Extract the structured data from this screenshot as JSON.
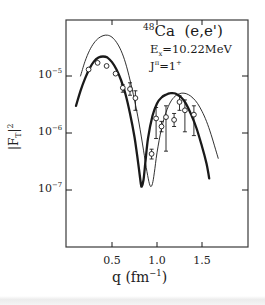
{
  "chart_data": {
    "type": "line",
    "annotations": {
      "nucleus_mass": "48",
      "nucleus_symbol": "Ca",
      "reaction": "(e,e')",
      "excitation_label": "E",
      "excitation_sub": "x",
      "excitation_value": "=10.22MeV",
      "spin_label": "J",
      "spin_sup": "π",
      "spin_value": "=1",
      "spin_parity": "+"
    },
    "xlabel": "q (fm⁻¹)",
    "xlabel_parts": {
      "main": "q  (fm",
      "sup": "−1",
      "end": ")"
    },
    "ylabel": "|F_T|²",
    "ylabel_parts": {
      "main": "|F",
      "sub": "T",
      "sup": "2",
      "end": "|"
    },
    "xlim": [
      0.0,
      2.02
    ],
    "ylim_log10": [
      -4.25,
      -7.97
    ],
    "yscale": "log",
    "x_ticks": [
      0.5,
      1.0,
      1.5
    ],
    "x_tick_labels": [
      "0.5",
      "1.0",
      "1.5"
    ],
    "y_ticks_log10": [
      -5,
      -6,
      -7
    ],
    "y_tick_labels": [
      {
        "base": "10",
        "exp": "−5"
      },
      {
        "base": "10",
        "exp": "−6"
      },
      {
        "base": "10",
        "exp": "−7"
      }
    ],
    "grid": false,
    "legend": "none",
    "series": [
      {
        "name": "thick-curve",
        "style": "solid-thick",
        "x": [
          0.1,
          0.15,
          0.2,
          0.25,
          0.3,
          0.35,
          0.4,
          0.45,
          0.5,
          0.55,
          0.6,
          0.65,
          0.7,
          0.75,
          0.78,
          0.8,
          0.82,
          0.83,
          0.85,
          0.87,
          0.9,
          0.95,
          1.0,
          1.05,
          1.1,
          1.15,
          1.18,
          1.22,
          1.27,
          1.32,
          1.38,
          1.44,
          1.5,
          1.55,
          1.58
        ],
        "y": [
          3e-06,
          5.5e-06,
          9e-06,
          1.35e-05,
          1.8e-05,
          2.1e-05,
          2.2e-05,
          2.1e-05,
          1.75e-05,
          1.3e-05,
          8.5e-06,
          4.8e-06,
          2.2e-06,
          8.5e-07,
          4e-07,
          2.3e-07,
          1.3e-07,
          1.15e-07,
          1.5e-07,
          3e-07,
          8e-07,
          2e-06,
          3.3e-06,
          4.2e-06,
          4.7e-06,
          5e-06,
          5e-06,
          4.8e-06,
          4.2e-06,
          3.3e-06,
          2.1e-06,
          1.2e-06,
          5.8e-07,
          2.9e-07,
          1.6e-07
        ]
      },
      {
        "name": "thin-curve",
        "style": "solid-thin",
        "x": [
          0.15,
          0.2,
          0.25,
          0.3,
          0.35,
          0.4,
          0.45,
          0.5,
          0.55,
          0.6,
          0.65,
          0.7,
          0.75,
          0.8,
          0.85,
          0.88,
          0.91,
          0.93,
          0.95,
          0.97,
          1.0,
          1.05,
          1.1,
          1.15,
          1.2,
          1.25,
          1.3,
          1.35,
          1.4,
          1.45,
          1.5,
          1.55,
          1.6,
          1.65,
          1.68
        ],
        "y": [
          1e-05,
          1.8e-05,
          2.8e-05,
          3.8e-05,
          4.6e-05,
          5.1e-05,
          5.2e-05,
          4.8e-05,
          3.9e-05,
          2.8e-05,
          1.7e-05,
          8.5e-06,
          3.8e-06,
          1.5e-06,
          5e-07,
          2.5e-07,
          1.4e-07,
          1.15e-07,
          1.3e-07,
          2e-07,
          4.5e-07,
          1.2e-06,
          2.3e-06,
          3.5e-06,
          4.4e-06,
          4.9e-06,
          5e-06,
          4.7e-06,
          4.1e-06,
          3.3e-06,
          2.4e-06,
          1.6e-06,
          9.5e-07,
          5.2e-07,
          3.6e-07
        ]
      },
      {
        "name": "measured-data",
        "style": "open-circles-with-error-bars",
        "x": [
          0.24,
          0.34,
          0.44,
          0.54,
          0.62,
          0.7,
          0.76,
          0.94,
          0.99,
          1.05,
          1.1,
          1.19,
          1.25,
          1.31,
          1.41
        ],
        "y": [
          1.3e-05,
          1.7e-05,
          1.5e-05,
          1.1e-05,
          6.2e-06,
          5.9e-06,
          4.1e-06,
          4.3e-07,
          1.8e-06,
          1.3e-06,
          1.9e-06,
          1.7e-06,
          3.5e-06,
          2.5e-06,
          2.1e-06
        ],
        "y_err_low": [
          null,
          null,
          null,
          null,
          5.2e-06,
          4.6e-06,
          2.5e-06,
          3.5e-07,
          8e-07,
          1.05e-06,
          4.8e-07,
          1.3e-06,
          2.5e-06,
          1.05e-06,
          9e-07
        ],
        "y_err_high": [
          null,
          null,
          null,
          null,
          7e-06,
          7.6e-06,
          5.5e-06,
          5.2e-07,
          2.8e-06,
          1.6e-06,
          3e-06,
          2.2e-06,
          4.5e-06,
          3.8e-06,
          3e-06
        ]
      }
    ]
  },
  "colors": {
    "ink": "#1a1a1a",
    "frame": "#3a3a3a",
    "background": "#ffffff"
  }
}
